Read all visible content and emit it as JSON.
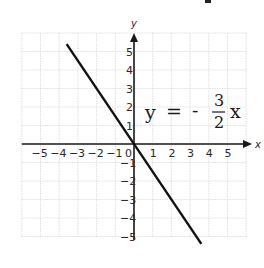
{
  "chart_data": {
    "type": "line",
    "title": "",
    "equation": {
      "lhs": "y",
      "equals": "=",
      "sign": "-",
      "numerator": "3",
      "denominator": "2",
      "var": "x"
    },
    "xlabel": "x",
    "ylabel": "y",
    "xlim": [
      -6,
      6
    ],
    "ylim": [
      -5,
      6
    ],
    "grid": true,
    "x_ticks": [
      "-5",
      "-4",
      "-3",
      "-2",
      "-1",
      "0",
      "1",
      "2",
      "3",
      "4",
      "5"
    ],
    "y_ticks": [
      "5",
      "4",
      "3",
      "2",
      "1",
      "-1",
      "-2",
      "-3",
      "-4",
      "-5"
    ],
    "series": [
      {
        "name": "y = -3/2 x",
        "x": [
          -3.6,
          3.6
        ],
        "y": [
          5.4,
          -5.4
        ],
        "slope": -1.5,
        "intercept": 0,
        "color": "#111111"
      }
    ]
  },
  "colors": {
    "grid": "#d8d8d8",
    "axis": "#1a1a1a",
    "line": "#111111",
    "text": "#2a2a2a"
  }
}
